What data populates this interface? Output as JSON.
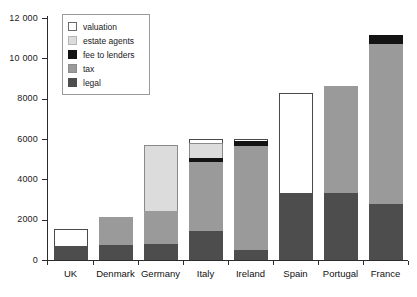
{
  "chart_data": {
    "type": "bar",
    "subtype": "stacked-bar",
    "title": "",
    "xlabel": "",
    "ylabel": "",
    "ylim": [
      0,
      12000
    ],
    "ytick_labels": [
      "0",
      "2000",
      "4000",
      "6000",
      "8000",
      "10 000",
      "12 000"
    ],
    "ytick_values": [
      0,
      2000,
      4000,
      6000,
      8000,
      10000,
      12000
    ],
    "grid": false,
    "legend_position": "top-left-inside",
    "categories": [
      "UK",
      "Denmark",
      "Germany",
      "Italy",
      "Ireland",
      "Spain",
      "Portugal",
      "France"
    ],
    "series": [
      {
        "name": "legal",
        "color": "#4d4d4d",
        "values": [
          700,
          750,
          800,
          1450,
          500,
          3320,
          3320,
          2800
        ]
      },
      {
        "name": "tax",
        "color": "#9a9a9a",
        "values": [
          0,
          1400,
          1650,
          3400,
          5150,
          0,
          5330,
          7900
        ]
      },
      {
        "name": "fee to lenders",
        "color": "#131313",
        "values": [
          0,
          0,
          0,
          230,
          270,
          0,
          0,
          480
        ]
      },
      {
        "name": "estate agents",
        "color": "#dcdcdc",
        "values": [
          0,
          0,
          3250,
          700,
          0,
          0,
          0,
          0
        ]
      },
      {
        "name": "valuation",
        "color": "#ffffff",
        "values": [
          850,
          0,
          0,
          220,
          80,
          4980,
          0,
          0
        ]
      }
    ],
    "totals": [
      1550,
      2150,
      5700,
      6000,
      6000,
      8300,
      8650,
      11180
    ]
  },
  "legend": {
    "items": [
      {
        "label": "valuation",
        "swatch": "valuation"
      },
      {
        "label": "estate agents",
        "swatch": "estate"
      },
      {
        "label": "fee to lenders",
        "swatch": "fee"
      },
      {
        "label": "tax",
        "swatch": "tax"
      },
      {
        "label": "legal",
        "swatch": "legal"
      }
    ]
  },
  "colors": {
    "valuation": "#ffffff",
    "estate_agents": "#dcdcdc",
    "fee_to_lenders": "#131313",
    "tax": "#9a9a9a",
    "legal": "#4d4d4d",
    "axis": "#2b2b2b",
    "background": "#ffffff"
  }
}
